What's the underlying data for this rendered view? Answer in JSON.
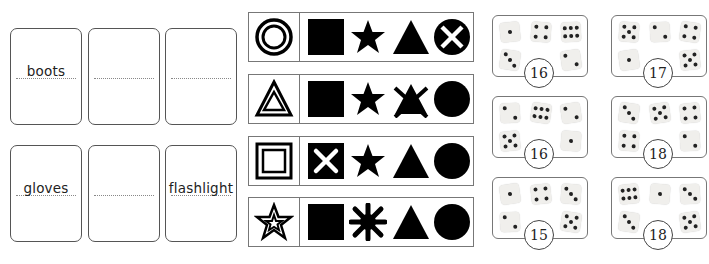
{
  "word_cards": [
    {
      "word": "boots"
    },
    {
      "word": ""
    },
    {
      "word": ""
    },
    {
      "word": "gloves"
    },
    {
      "word": ""
    },
    {
      "word": "flashlight"
    }
  ],
  "shape_strips": [
    {
      "key": "double-circle",
      "shapes": [
        "square",
        "star",
        "triangle",
        "circle-with-x"
      ]
    },
    {
      "key": "double-triangle",
      "shapes": [
        "square",
        "star",
        "crossed-triangle",
        "circle"
      ]
    },
    {
      "key": "double-square",
      "shapes": [
        "square-with-x",
        "star",
        "triangle",
        "circle"
      ]
    },
    {
      "key": "double-star",
      "shapes": [
        "square",
        "asterisk-burst",
        "triangle",
        "circle"
      ]
    }
  ],
  "dice_cards": [
    {
      "dice": [
        1,
        4,
        6,
        3,
        2
      ],
      "total": "16"
    },
    {
      "dice": [
        5,
        2,
        4,
        1,
        5
      ],
      "total": "17"
    },
    {
      "dice": [
        2,
        6,
        2,
        5,
        1
      ],
      "total": "16"
    },
    {
      "dice": [
        3,
        5,
        4,
        4,
        2
      ],
      "total": "18"
    },
    {
      "dice": [
        1,
        4,
        3,
        2,
        5
      ],
      "total": "15"
    },
    {
      "dice": [
        6,
        1,
        3,
        3,
        5
      ],
      "total": "18"
    }
  ]
}
